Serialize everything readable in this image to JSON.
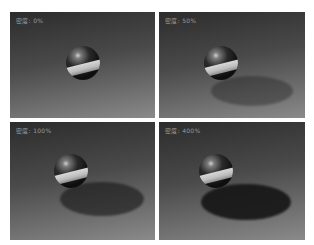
{
  "figure": {
    "panels": [
      {
        "label": "密度: 0%",
        "shadow_opacity": 0.0
      },
      {
        "label": "密度: 50%",
        "shadow_opacity": 0.35
      },
      {
        "label": "密度: 100%",
        "shadow_opacity": 0.6
      },
      {
        "label": "密度: 400%",
        "shadow_opacity": 0.9
      }
    ]
  }
}
